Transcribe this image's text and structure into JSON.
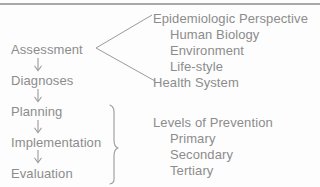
{
  "figure": {
    "text_color": "#8c8c8c",
    "rule_color": "#a8a8a8",
    "background": "#fdfdfd"
  },
  "process_column": {
    "steps": [
      {
        "label": "Assessment"
      },
      {
        "label": "Diagnoses"
      },
      {
        "label": "Planning"
      },
      {
        "label": "Implementation"
      },
      {
        "label": "Evaluation"
      }
    ],
    "arrow_glyph": "down-arrow"
  },
  "assessment_branch": {
    "connector": "fan-lines",
    "heading": "Epidemiologic Perspective",
    "items": [
      "Human Biology",
      "Environment",
      "Life-style"
    ],
    "last_item": "Health System"
  },
  "prevention_group": {
    "connector": "curly-brace",
    "heading": "Levels of Prevention",
    "items": [
      "Primary",
      "Secondary",
      "Tertiary"
    ]
  }
}
